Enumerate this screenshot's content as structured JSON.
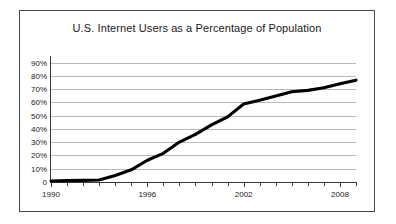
{
  "chart_data": {
    "type": "line",
    "title": "U.S. Internet Users as a Percentage of Population",
    "xlabel": "",
    "ylabel": "",
    "xlim": [
      1990,
      2009
    ],
    "ylim": [
      0,
      95
    ],
    "grid": true,
    "legend": "none",
    "y_tick_labels": [
      "90%",
      "80%",
      "70%",
      "60%",
      "50%",
      "40%",
      "30%",
      "20%",
      "10%",
      "0"
    ],
    "y_tick_values": [
      90,
      80,
      70,
      60,
      50,
      40,
      30,
      20,
      10,
      0
    ],
    "x_tick_labels": [
      "1990",
      "1996",
      "2002",
      "2008"
    ],
    "x_tick_values": [
      1990,
      1996,
      2002,
      2008
    ],
    "x_minor_ticks": [
      1990,
      1991,
      1992,
      1993,
      1994,
      1995,
      1996,
      1997,
      1998,
      1999,
      2000,
      2001,
      2002,
      2003,
      2004,
      2005,
      2006,
      2007,
      2008,
      2009
    ],
    "x": [
      1990,
      1991,
      1992,
      1993,
      1994,
      1995,
      1996,
      1997,
      1998,
      1999,
      2000,
      2001,
      2002,
      2003,
      2004,
      2005,
      2006,
      2007,
      2008,
      2009
    ],
    "values": [
      0.8,
      1.0,
      1.2,
      1.5,
      4.9,
      9.2,
      16.4,
      21.6,
      30.1,
      35.9,
      43.1,
      49.1,
      58.8,
      61.7,
      64.8,
      68.0,
      69.1,
      71.0,
      74.0,
      76.8
    ],
    "series": [
      {
        "name": "U.S. Internet Users (% of population)",
        "color": "#000000",
        "values": [
          0.8,
          1.0,
          1.2,
          1.5,
          4.9,
          9.2,
          16.4,
          21.6,
          30.1,
          35.9,
          43.1,
          49.1,
          58.8,
          61.7,
          64.8,
          68.0,
          69.1,
          71.0,
          74.0,
          76.8
        ]
      }
    ],
    "colors": {
      "line": "#000000",
      "grid": "#b9b9b9",
      "axis": "#3a3a3a",
      "frame": "#4a4a4a",
      "text": "#1a1a1a",
      "background": "#ffffff"
    }
  }
}
